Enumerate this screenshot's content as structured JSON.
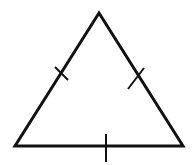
{
  "diagram": {
    "type": "equilateral-triangle",
    "stroke_color": "#111111",
    "background_color": "#ffffff",
    "stroke_width": 3,
    "vertices": {
      "top": [
        99,
        13
      ],
      "bottom_left": [
        15,
        146
      ],
      "bottom_right": [
        183,
        146
      ]
    },
    "tick_marks": [
      {
        "side": "left",
        "x1": 55,
        "y1": 67,
        "x2": 68,
        "y2": 80
      },
      {
        "side": "right",
        "x1": 144,
        "y1": 68,
        "x2": 128,
        "y2": 89
      },
      {
        "side": "bottom",
        "x1": 106,
        "y1": 134,
        "x2": 106,
        "y2": 162
      }
    ],
    "tick_count_per_side": 1
  }
}
